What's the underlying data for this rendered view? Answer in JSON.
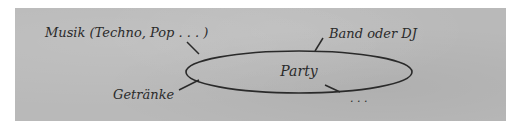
{
  "diagram": {
    "type": "mind-map",
    "center": {
      "label": "Party"
    },
    "branches": [
      {
        "id": "musik",
        "label": "Musik (Techno, Pop . . . )",
        "position": "top-left"
      },
      {
        "id": "band",
        "label": "Band oder DJ",
        "position": "top-right"
      },
      {
        "id": "getraenke",
        "label": "Getränke",
        "position": "bottom-left"
      },
      {
        "id": "more",
        "label": ". . .",
        "position": "bottom-right"
      }
    ]
  },
  "colors": {
    "panel_background": "#b9b9b9",
    "page_background": "#ffffff",
    "ink": "#2a2a2a"
  }
}
